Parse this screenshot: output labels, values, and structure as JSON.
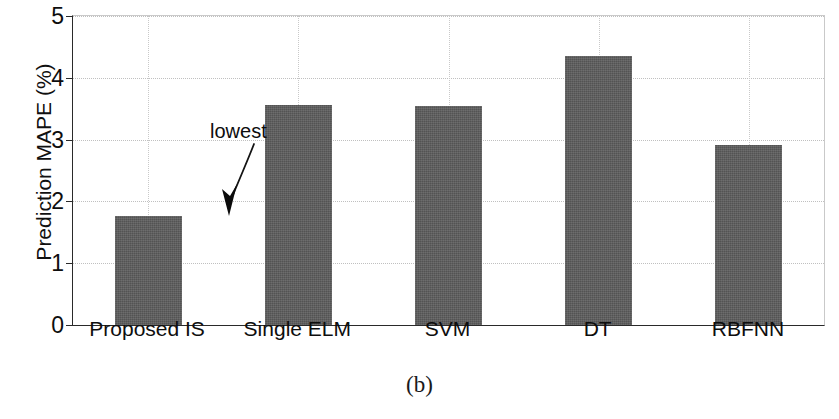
{
  "chart_data": {
    "type": "bar",
    "title": "",
    "xlabel": "",
    "ylabel": "Prediction MAPE (%)",
    "categories": [
      "Proposed IS",
      "Single  ELM",
      "SVM",
      "DT",
      "RBFNN"
    ],
    "values": [
      1.77,
      3.56,
      3.55,
      4.35,
      2.92
    ],
    "ylim": [
      0,
      5
    ],
    "yticks": [
      0,
      1,
      2,
      3,
      4,
      5
    ],
    "ytick_labels": [
      "0",
      "1",
      "2",
      "3",
      "4",
      "5"
    ],
    "grid": "both-dotted",
    "legend": "none",
    "bar_color": "#5d5d5d",
    "annotations": [
      {
        "text": "lowest",
        "target_category": "Proposed IS",
        "arrow": "curved-down-left"
      }
    ]
  },
  "caption": {
    "label": "(b)"
  }
}
